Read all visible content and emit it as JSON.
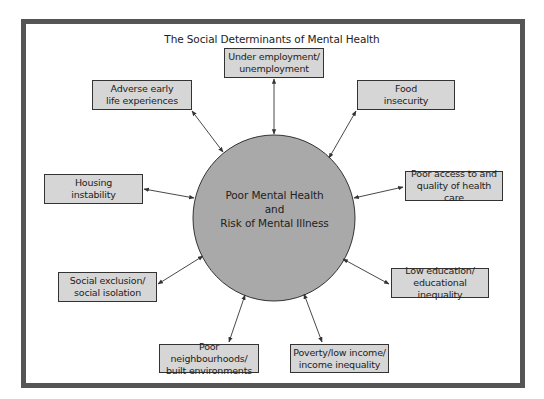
{
  "diagram": {
    "title": "The Social Determinants of Mental Health",
    "center": {
      "line1": "Poor Mental Health",
      "line2": "and",
      "line3": "Risk of Mental Illness",
      "fill": "#a9a9a9"
    },
    "determinants": [
      {
        "id": "under-employment",
        "line1": "Under employment/",
        "line2": "unemployment"
      },
      {
        "id": "food-insecurity",
        "line1": "Food",
        "line2": "insecurity"
      },
      {
        "id": "poor-access-health-care",
        "line1": "Poor access to and",
        "line2": "quality of health care"
      },
      {
        "id": "low-education",
        "line1": "Low education/",
        "line2": "educational inequality"
      },
      {
        "id": "poverty",
        "line1": "Poverty/low income/",
        "line2": "income inequality"
      },
      {
        "id": "poor-neighbourhoods",
        "line1": "Poor neighbourhoods/",
        "line2": "built environments"
      },
      {
        "id": "social-exclusion",
        "line1": "Social exclusion/",
        "line2": "social isolation"
      },
      {
        "id": "housing-instability",
        "line1": "Housing",
        "line2": "instability"
      },
      {
        "id": "adverse-early-life",
        "line1": "Adverse early",
        "line2": "life experiences"
      }
    ],
    "connection_type": "bidirectional-arrow",
    "colors": {
      "frame": "#555555",
      "box_fill": "#d6d6d6",
      "box_border": "#333333",
      "circle_fill": "#a9a9a9",
      "arrow": "#333333"
    }
  }
}
